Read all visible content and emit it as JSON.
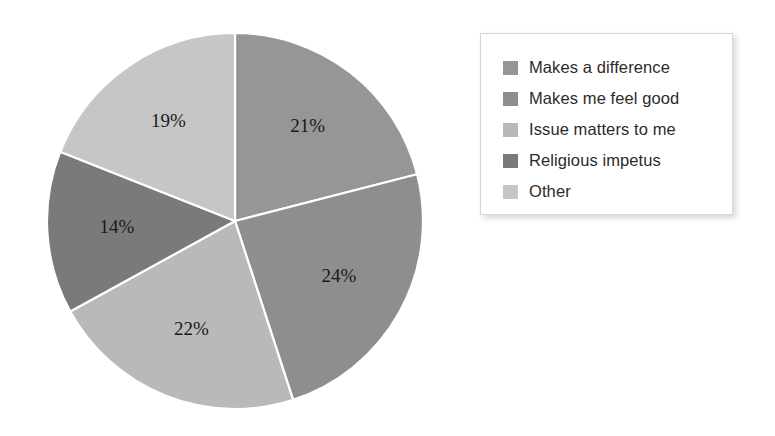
{
  "chart_data": {
    "type": "pie",
    "title": "",
    "subtitle": "",
    "xlabel": "",
    "ylabel": "",
    "grid": false,
    "legend_position": "right",
    "start_angle_deg": 0,
    "direction": "clockwise",
    "units": "percent",
    "categories": [
      "Makes a difference",
      "Makes me feel good",
      "Issue matters to me",
      "Religious impetus",
      "Other"
    ],
    "values": [
      21,
      24,
      22,
      14,
      19
    ],
    "data_labels": [
      "21%",
      "24%",
      "22%",
      "14%",
      "19%"
    ],
    "colors": [
      "#969696",
      "#8e8e8e",
      "#b9b9b9",
      "#7a7a7a",
      "#c6c6c6"
    ],
    "slices": [
      {
        "label": "Makes a difference",
        "value": 21,
        "data_label": "21%",
        "color": "#969696"
      },
      {
        "label": "Makes me feel good",
        "value": 24,
        "data_label": "24%",
        "color": "#8e8e8e"
      },
      {
        "label": "Issue matters to me",
        "value": 22,
        "data_label": "22%",
        "color": "#b9b9b9"
      },
      {
        "label": "Religious impetus",
        "value": 14,
        "data_label": "14%",
        "color": "#7a7a7a"
      },
      {
        "label": "Other",
        "value": 19,
        "data_label": "19%",
        "color": "#c6c6c6"
      }
    ]
  },
  "legend": {
    "items": [
      {
        "label": "Makes a difference",
        "color": "#969696"
      },
      {
        "label": "Makes me feel good",
        "color": "#8e8e8e"
      },
      {
        "label": "Issue matters to me",
        "color": "#b9b9b9"
      },
      {
        "label": "Religious impetus",
        "color": "#7a7a7a"
      },
      {
        "label": "Other",
        "color": "#c6c6c6"
      }
    ]
  },
  "style": {
    "background": "#ffffff",
    "slice_separator": "#ffffff",
    "label_color": "#1a1a1a"
  }
}
